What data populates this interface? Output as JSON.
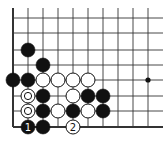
{
  "diagram": {
    "type": "go-board-fragment",
    "background": "#ffffff",
    "line_color": "#333333",
    "grid": {
      "cols_x": [
        13,
        28,
        43,
        58,
        73,
        88,
        103,
        118,
        133,
        148
      ],
      "rows_y": [
        18,
        33,
        50,
        65,
        80,
        96,
        111,
        127
      ],
      "extend_right_to": 163,
      "extend_top_to": 8,
      "left_edge": true,
      "bottom_edge": true
    },
    "stone_radius": 7,
    "star_points": [
      {
        "col": 9,
        "row": 4
      }
    ],
    "stones": [
      {
        "col": 1,
        "row": 2,
        "color": "black"
      },
      {
        "col": 2,
        "row": 3,
        "color": "black"
      },
      {
        "col": 0,
        "row": 4,
        "color": "black"
      },
      {
        "col": 1,
        "row": 4,
        "color": "black"
      },
      {
        "col": 2,
        "row": 4,
        "color": "white"
      },
      {
        "col": 3,
        "row": 4,
        "color": "white"
      },
      {
        "col": 4,
        "row": 4,
        "color": "white"
      },
      {
        "col": 5,
        "row": 4,
        "color": "white"
      },
      {
        "col": 1,
        "row": 5,
        "color": "white",
        "mark": "circle"
      },
      {
        "col": 2,
        "row": 5,
        "color": "black"
      },
      {
        "col": 4,
        "row": 5,
        "color": "white"
      },
      {
        "col": 5,
        "row": 5,
        "color": "black"
      },
      {
        "col": 6,
        "row": 5,
        "color": "black"
      },
      {
        "col": 1,
        "row": 6,
        "color": "white",
        "mark": "circle"
      },
      {
        "col": 2,
        "row": 6,
        "color": "black"
      },
      {
        "col": 3,
        "row": 6,
        "color": "white"
      },
      {
        "col": 4,
        "row": 6,
        "color": "black"
      },
      {
        "col": 5,
        "row": 6,
        "color": "white"
      },
      {
        "col": 6,
        "row": 6,
        "color": "black"
      },
      {
        "col": 1,
        "row": 7,
        "color": "black",
        "label": "1"
      },
      {
        "col": 2,
        "row": 7,
        "color": "black"
      },
      {
        "col": 4,
        "row": 7,
        "color": "white",
        "label": "2"
      }
    ]
  }
}
